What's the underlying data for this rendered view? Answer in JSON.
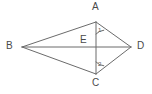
{
  "figure": {
    "kind": "geometry-diagram",
    "shape_name": "kite BACD with diagonals",
    "background_color": "#ffffff",
    "stroke_color": "#6b6b6b",
    "label_color": "#4a4a4a",
    "angle_label_color": "#5a5a5a",
    "stroke_width": 1
  },
  "points": {
    "A": {
      "label": "A",
      "x": 96,
      "y": 22,
      "label_x": 92,
      "label_y": 3
    },
    "B": {
      "label": "B",
      "x": 22,
      "y": 47,
      "label_x": 7,
      "label_y": 42
    },
    "C": {
      "label": "C",
      "x": 96,
      "y": 74,
      "label_x": 92,
      "label_y": 79
    },
    "D": {
      "label": "D",
      "x": 131,
      "y": 47,
      "label_x": 137,
      "label_y": 42
    },
    "E": {
      "label": "E",
      "x": 96,
      "y": 47,
      "label_x": 81,
      "label_y": 37
    }
  },
  "segments": [
    {
      "name": "segment-BA",
      "from": "B",
      "to": "A"
    },
    {
      "name": "segment-AD",
      "from": "A",
      "to": "D"
    },
    {
      "name": "segment-DC",
      "from": "D",
      "to": "C"
    },
    {
      "name": "segment-CB",
      "from": "C",
      "to": "B"
    },
    {
      "name": "diagonal-BD",
      "from": "B",
      "to": "D"
    },
    {
      "name": "diagonal-AC",
      "from": "A",
      "to": "C"
    }
  ],
  "angles": [
    {
      "name": "angle-1",
      "label": "1",
      "vertex": "A",
      "between": [
        "A-E",
        "A-D"
      ],
      "label_x": 97,
      "label_y": 29
    },
    {
      "name": "angle-2",
      "label": "2",
      "vertex": "C",
      "between": [
        "C-E",
        "C-D"
      ],
      "label_x": 97,
      "label_y": 63
    }
  ]
}
